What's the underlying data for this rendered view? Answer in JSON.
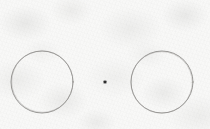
{
  "scene": {
    "title": "Two hand-drawn circles with a center dot",
    "medium": "pencil-on-paper",
    "width": 210,
    "height": 129,
    "background_color": "#f8f8f7",
    "paper_tint_color": "#c9c9c6",
    "stroke_color": "#8a8a8a",
    "dot_color": "#2e2e2e"
  },
  "shapes": {
    "left_circle": {
      "name": "left-circle",
      "label": "Left circle",
      "center_x": 42,
      "center_y": 82,
      "radius": 31,
      "stroke_color": "#8d8c8a",
      "stroke_width": 0.9,
      "fill": "none"
    },
    "right_circle": {
      "name": "right-circle",
      "label": "Right circle",
      "center_x": 162,
      "center_y": 82,
      "radius": 31,
      "stroke_color": "#8d8c8a",
      "stroke_width": 0.9,
      "fill": "none"
    },
    "center_dot": {
      "name": "center-dot",
      "label": "Center dot",
      "center_x": 105,
      "center_y": 82,
      "size": 2.6,
      "fill_color": "#2e2e2e"
    }
  },
  "annotations": {
    "shape_count_label": "3 marks",
    "circle_count_label": "2 circles",
    "dot_count_label": "1 dot"
  }
}
